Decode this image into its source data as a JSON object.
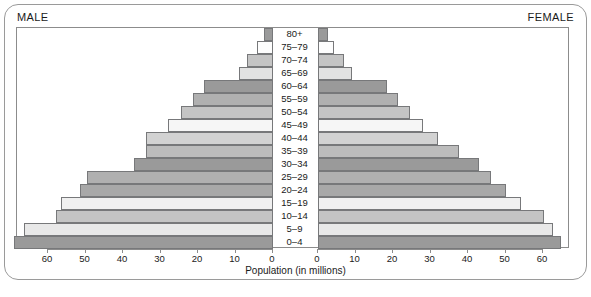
{
  "header": {
    "male_label": "MALE",
    "female_label": "FEMALE"
  },
  "axis_title": "Population (in millions)",
  "chart_data": {
    "type": "bar",
    "subtype": "population-pyramid",
    "title": "",
    "xlabel": "Population (in millions)",
    "ylabel": "",
    "grid": false,
    "legend": null,
    "orientation": "horizontal",
    "categories": [
      "80+",
      "75–79",
      "70–74",
      "65–69",
      "60–64",
      "55–59",
      "50–54",
      "45–49",
      "40–44",
      "35–39",
      "30–34",
      "25–29",
      "20–24",
      "15–19",
      "10–14",
      "5–9",
      "0–4"
    ],
    "series": [
      {
        "name": "MALE",
        "side": "left",
        "axis_ticks": [
          60,
          50,
          40,
          30,
          20,
          10,
          0
        ],
        "xlim": [
          60,
          0
        ],
        "values": [
          2.4,
          4.3,
          7.0,
          9.1,
          18.5,
          21.4,
          24.6,
          28.0,
          34.0,
          34.0,
          37.0,
          49.5,
          51.5,
          56.5,
          58.0,
          66.5,
          69.0
        ]
      },
      {
        "name": "FEMALE",
        "side": "right",
        "axis_ticks": [
          0,
          10,
          20,
          30,
          40,
          50,
          60
        ],
        "xlim": [
          0,
          60
        ],
        "values": [
          2.7,
          4.3,
          7.0,
          9.1,
          18.5,
          21.4,
          24.6,
          28.0,
          32.0,
          37.6,
          42.9,
          46.1,
          50.1,
          54.1,
          60.3,
          62.7,
          64.8
        ]
      }
    ],
    "bar_shades": [
      "#9a9a9a",
      "#fdfdfd",
      "#c4c4c4",
      "#e2e2e2",
      "#9a9a9a",
      "#b0b0b0",
      "#c4c4c4",
      "#f6f6f6",
      "#d2d2d2",
      "#bcbcbc",
      "#9a9a9a",
      "#b0b0b0",
      "#a8a8a8",
      "#f0f0f0",
      "#c4c4c4",
      "#e8e8e8",
      "#9a9a9a"
    ]
  }
}
